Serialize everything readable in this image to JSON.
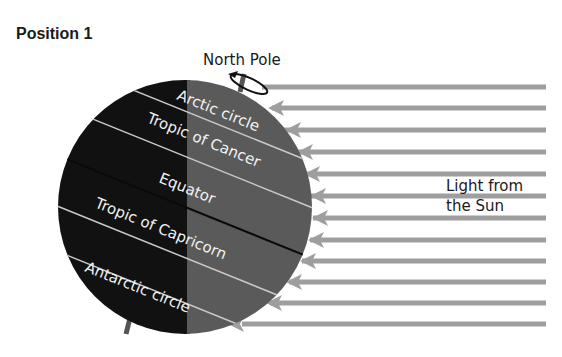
{
  "title": "Position 1",
  "labels": {
    "north_pole": "North Pole",
    "arctic_circle": "Arctic circle",
    "tropic_of_cancer": "Tropic of Cancer",
    "equator": "Equator",
    "tropic_of_capricorn": "Tropic of Capricorn",
    "antarctic_circle": "Antarctic circle",
    "sun_line1": "Light from",
    "sun_line2": "the Sun"
  },
  "colors": {
    "night_side": "#111111",
    "day_side": "#5a5a5a",
    "light_arrows": "#9e9e9e",
    "latitude_lines": "#c8c8c8",
    "equator_line": "#0a0a0a"
  },
  "light_rays": {
    "count": 12
  }
}
